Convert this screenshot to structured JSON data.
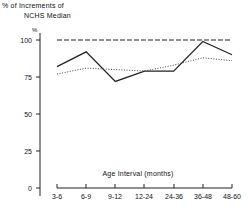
{
  "chart_data": {
    "type": "line",
    "title": "% of Increments of NCHS Median",
    "title_line_1": "% of Increments of",
    "title_line_2": "NCHS Median",
    "xlabel": "Age Interval (months)",
    "ylabel": "%",
    "y_axis_unit_marker": "%",
    "categories": [
      "3-6",
      "6-9",
      "9-12",
      "12-24",
      "24-36",
      "36-48",
      "48-60"
    ],
    "ylim": [
      0,
      100
    ],
    "yticks": [
      0,
      25,
      50,
      75,
      100
    ],
    "ytick_labels": [
      "0",
      "25",
      "50",
      "75",
      "100"
    ],
    "grid": false,
    "legend": "none",
    "series": [
      {
        "name": "NCHS Median Reference",
        "style": "dashed",
        "color": "#222222",
        "values": [
          100,
          100,
          100,
          100,
          100,
          100,
          100
        ]
      },
      {
        "name": "Observed Solid",
        "style": "solid",
        "color": "#222222",
        "values": [
          82,
          92,
          72,
          79,
          79,
          99,
          90
        ]
      },
      {
        "name": "Observed Dotted",
        "style": "dotted",
        "color": "#444444",
        "values": [
          77,
          81,
          80,
          79,
          83,
          88,
          86
        ]
      }
    ]
  },
  "axis": {
    "ytick_0": "0",
    "ytick_25": "25",
    "ytick_50": "50",
    "ytick_75": "75",
    "ytick_100": "100",
    "xtick_0": "3-6",
    "xtick_1": "6-9",
    "xtick_2": "9-12",
    "xtick_3": "12-24",
    "xtick_4": "24-36",
    "xtick_5": "36-48",
    "xtick_6": "48-60"
  }
}
